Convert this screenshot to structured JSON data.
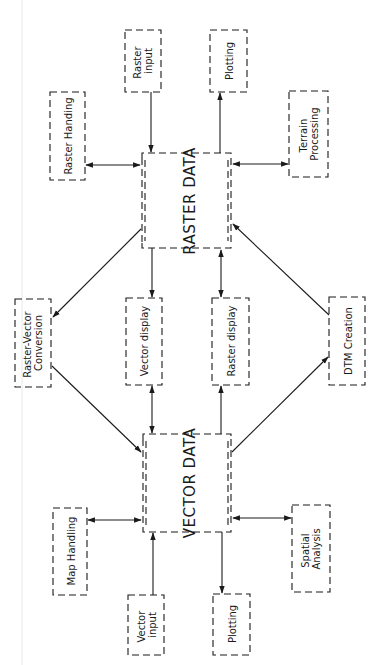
{
  "diagram": {
    "type": "flowchart",
    "orientation": "rotated-90-ccw",
    "central_nodes": [
      {
        "id": "raster_data",
        "label": "RASTER DATA"
      },
      {
        "id": "vector_data",
        "label": "VECTOR DATA"
      }
    ],
    "nodes": [
      {
        "id": "raster_handling",
        "label": "Raster Handing"
      },
      {
        "id": "raster_input",
        "label_lines": [
          "Raster",
          "input"
        ]
      },
      {
        "id": "plotting_top",
        "label": "Plotting"
      },
      {
        "id": "terrain_processing",
        "label_lines": [
          "Terrain",
          "Processing"
        ]
      },
      {
        "id": "raster_vector_conversion",
        "label_lines": [
          "Raster-Vector",
          "Conversion"
        ]
      },
      {
        "id": "vector_display",
        "label": "Vector display"
      },
      {
        "id": "raster_display",
        "label": "Raster display"
      },
      {
        "id": "dtm_creation",
        "label": "DTM Creation"
      },
      {
        "id": "map_handling",
        "label": "Map Handling"
      },
      {
        "id": "vector_input",
        "label_lines": [
          "Vector",
          "input"
        ]
      },
      {
        "id": "plotting_bottom",
        "label": "Plotting"
      },
      {
        "id": "spatial_analysis",
        "label_lines": [
          "Spatial",
          "Analysis"
        ]
      }
    ],
    "edges": [
      {
        "from": "raster_handling",
        "to": "raster_data",
        "type": "bidirectional"
      },
      {
        "from": "raster_input",
        "to": "raster_data",
        "type": "directed"
      },
      {
        "from": "raster_data",
        "to": "plotting_top",
        "type": "directed"
      },
      {
        "from": "terrain_processing",
        "to": "raster_data",
        "type": "bidirectional"
      },
      {
        "from": "raster_data",
        "to": "raster_vector_conversion",
        "type": "directed"
      },
      {
        "from": "raster_data",
        "to": "vector_display",
        "type": "directed"
      },
      {
        "from": "raster_data",
        "to": "raster_display",
        "type": "bidirectional"
      },
      {
        "from": "dtm_creation",
        "to": "raster_data",
        "type": "directed"
      },
      {
        "from": "raster_vector_conversion",
        "to": "vector_data",
        "type": "directed"
      },
      {
        "from": "vector_display",
        "to": "vector_data",
        "type": "bidirectional"
      },
      {
        "from": "vector_data",
        "to": "raster_display",
        "type": "directed"
      },
      {
        "from": "vector_data",
        "to": "dtm_creation",
        "type": "directed"
      },
      {
        "from": "map_handling",
        "to": "vector_data",
        "type": "bidirectional"
      },
      {
        "from": "vector_input",
        "to": "vector_data",
        "type": "directed"
      },
      {
        "from": "vector_data",
        "to": "plotting_bottom",
        "type": "directed"
      },
      {
        "from": "spatial_analysis",
        "to": "vector_data",
        "type": "bidirectional"
      }
    ]
  }
}
